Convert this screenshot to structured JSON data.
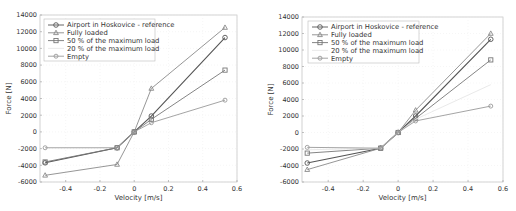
{
  "chart_data": [
    {
      "type": "line",
      "title": "",
      "xlabel": "Velocity [m/s]",
      "ylabel": "Force [N]",
      "xlim": [
        -0.55,
        0.6
      ],
      "ylim": [
        -6000,
        14000
      ],
      "xticks": [
        "-0.4",
        "-0.2",
        "0",
        "0.2",
        "0.4",
        "0.6"
      ],
      "yticks": [
        "14000",
        "12000",
        "10000",
        "8000",
        "6000",
        "4000",
        "2000",
        "0",
        "-2000",
        "-4000",
        "-6000"
      ],
      "grid": true,
      "legend_position": "upper left",
      "x": [
        -0.52,
        -0.1,
        0,
        0.1,
        0.53
      ],
      "series": [
        {
          "name": "Airport in Hoskovice - reference",
          "color": "#555555",
          "marker": "circle",
          "values": [
            -3700,
            -1900,
            0,
            1900,
            11300
          ]
        },
        {
          "name": "Fully loaded",
          "color": "#8a8a8a",
          "marker": "triangle",
          "values": [
            -5200,
            -3900,
            0,
            5200,
            12500
          ]
        },
        {
          "name": "50 % of the maximum load",
          "color": "#777777",
          "marker": "square",
          "values": [
            -3600,
            -1900,
            0,
            1500,
            7400
          ]
        },
        {
          "name": "20 % of the maximum load",
          "color": "#e6e6e6",
          "marker": "none",
          "values": [
            null,
            null,
            null,
            null,
            null
          ]
        },
        {
          "name": "Empty",
          "color": "#9a9a9a",
          "marker": "diamond",
          "values": [
            -1900,
            -1900,
            0,
            1100,
            3800
          ]
        }
      ]
    },
    {
      "type": "line",
      "title": "",
      "xlabel": "Velocity [m/s]",
      "ylabel": "Force [N]",
      "xlim": [
        -0.55,
        0.6
      ],
      "ylim": [
        -6000,
        14000
      ],
      "xticks": [
        "-0.4",
        "-0.2",
        "0",
        "0.2",
        "0.4",
        "0.6"
      ],
      "yticks": [
        "14000",
        "12000",
        "10000",
        "8000",
        "6000",
        "4000",
        "2000",
        "0",
        "-2000",
        "-4000",
        "-6000"
      ],
      "grid": true,
      "legend_position": "upper left",
      "x": [
        -0.52,
        -0.1,
        0,
        0.1,
        0.53
      ],
      "series": [
        {
          "name": "Airport in Hoskovice - reference",
          "color": "#555555",
          "marker": "circle",
          "values": [
            -3700,
            -1900,
            0,
            2000,
            11300
          ]
        },
        {
          "name": "Fully loaded",
          "color": "#8a8a8a",
          "marker": "triangle",
          "values": [
            -4500,
            -1900,
            0,
            2700,
            12000
          ]
        },
        {
          "name": "50 % of the maximum load",
          "color": "#777777",
          "marker": "square",
          "values": [
            -2500,
            -1900,
            0,
            1700,
            8800
          ]
        },
        {
          "name": "20 % of the maximum load",
          "color": "#e6e6e6",
          "marker": "none",
          "values": [
            -2100,
            -1900,
            0,
            1600,
            5800
          ]
        },
        {
          "name": "Empty",
          "color": "#9a9a9a",
          "marker": "diamond",
          "values": [
            -1800,
            -1900,
            0,
            1400,
            3200
          ]
        }
      ]
    }
  ]
}
